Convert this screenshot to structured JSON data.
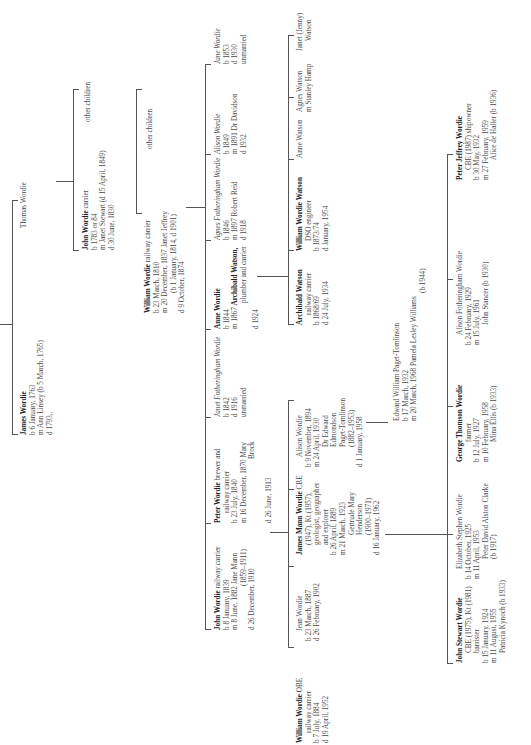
{
  "orientation": "rotated -90deg (reads bottom-to-top)",
  "generation_0": {
    "root_line": "Thomas Wordie"
  },
  "generation_1": {
    "thomas": {
      "name": "Thomas Wordie"
    },
    "james": {
      "name": "James Wordie",
      "born": "b  6 January, 1763",
      "married": "m  Ann Linsey (b 5 March, 1765)",
      "died": "d  1793,."
    }
  },
  "generation_2": {
    "john": {
      "name": "John Wordie",
      "occupation": " carrier",
      "born": "b  1783 or 84",
      "married": "m  Janet Stewart (d 15 April, 1849)",
      "died": "d  30 June, 1830"
    },
    "other_children_1": "other children"
  },
  "generation_3": {
    "william": {
      "name": "William Wordie",
      "occupation": " railway carrier",
      "born": "b  23 March, 1810",
      "married": "m  20 December, 1837 Janet Jeffrey",
      "married_detail": "(b 1 January, 1814, d 1901)",
      "died": "d  9 October, 1874"
    },
    "other_children_2": "other children"
  },
  "generation_4": [
    {
      "name": "John Wordie",
      "occupation": " railway carrier",
      "born": "b  8 January, 1839",
      "married": "m  8 June, 1882 Jane Mann",
      "married_detail": "(1859–1911)",
      "died": "d  26 December, 1910"
    },
    {
      "name": "Peter Wordie",
      "occupation": " brewer and",
      "occupation2": "railway carrier",
      "born": "b  23 July, 1840",
      "married": "m  16 December, 1870 Mary",
      "married_detail": "Brock",
      "died": "d  26 June, 1913"
    },
    {
      "name": "Janet Fotheringham Wordie",
      "born": "b  1842",
      "died": "d  1916",
      "status": "unmarried"
    },
    {
      "name": "Anne Wordie",
      "born": "b  1844",
      "married_prefix": "m  1867 ",
      "spouse": "Archibald Watson,",
      "spouse_occupation": "plumber and carrier",
      "died": "d  1924"
    },
    {
      "name": "Agnes Fotheringham Wordie",
      "born": "b  1846",
      "married": "m  1897 Robert Reid",
      "died": "d  1918"
    },
    {
      "name": "Alison Wordie",
      "born": "b  1849",
      "married": "m  1891 Dr Davidson",
      "died": "d  1932"
    },
    {
      "name": "Jane Wordie",
      "born": "b  1853",
      "died": "d  1930",
      "status": "unmarried"
    }
  ],
  "generation_5_wordie": [
    {
      "name": "William Wordie",
      "honour": " OBE",
      "occupation": "railway carrier",
      "born": "b 7 July, 1884",
      "died": "d 19 April, 1952"
    },
    {
      "name": "Jean Wordie",
      "born": "b 23 March, 1887",
      "died": "d 26 February, 1902"
    },
    {
      "name": "James Mann Wordie",
      "honour": " CBE",
      "line2": "(1947), Kt (1957),",
      "line3": "geologist, geographer",
      "line4": "and explorer",
      "born": "b  26 April, 1889",
      "married": "m  21 March, 1923",
      "spouse1": "Gertrude Mary",
      "spouse2": "Henderson",
      "spouse3": "(1900–1971)",
      "died": "d  16 January, 1962"
    },
    {
      "name": "Alison Wordie",
      "born": "b  9 November, 1894",
      "married": "m  24 April, 1930",
      "spouse1": "Dr Edward",
      "spouse2": "Edmondson",
      "spouse3": "Paget-Tomlinson",
      "spouse4": "(1882–1953)",
      "died": "d  1 January, 1958"
    }
  ],
  "generation_5_watson": [
    {
      "name": "Archibald Watson",
      "occupation": "railway carrier",
      "born": "b 1868/69",
      "died": "d 24 July, 1934"
    },
    {
      "name": "William Wordie Watson",
      "occupation": "DSO engineer",
      "born": "b 1873/74",
      "died": "d January, 1954"
    },
    {
      "name": "Anne Watson"
    },
    {
      "name": "Agnes Watson",
      "married": "m Stanley Hamp"
    },
    {
      "name": "Janet (Jenny)",
      "name2": "Watson"
    }
  ],
  "generation_6_paget": {
    "name": "Edward William Paget-Tomlinson",
    "born": "b  17 March, 1932",
    "married": "m  20 March, 1968 Pamela Lesley Williams",
    "married_detail": "(b 1944)"
  },
  "generation_6_wordie": [
    {
      "name": "John Stewart Wordie",
      "line2": "CBE (1975), Kt (1981)",
      "line3": "barrister",
      "born": "b  15 January, 1924",
      "married": "m  11 August, 1955",
      "spouse": "Patricia Kynoch (b 1933)"
    },
    {
      "name": "Elizabeth Stephen Wordie",
      "born": "b  14 October, 1925",
      "married": "m  11 April, 1953",
      "spouse": "Peter David Alston Clarke",
      "spouse2": "(b 1917)"
    },
    {
      "name": "George Thomson Wordie",
      "occupation": "farmer",
      "born": "b  12 July, 1927",
      "married": "m  10 February, 1958",
      "spouse": "Mina Ellis (b 1933)"
    },
    {
      "name": "Alison Fotheringham Wordie",
      "born": "b  24 February, 1929",
      "married": "m  15 July, 1961",
      "spouse": "John Stancer (b 1930)"
    },
    {
      "name": "Peter Jeffrey Wordie",
      "line2": "CBE (1987) shipowner",
      "born": "b  30 May, 1932",
      "married": "m  27 February, 1959",
      "spouse": "Alice de Haller (b 1936)"
    }
  ]
}
